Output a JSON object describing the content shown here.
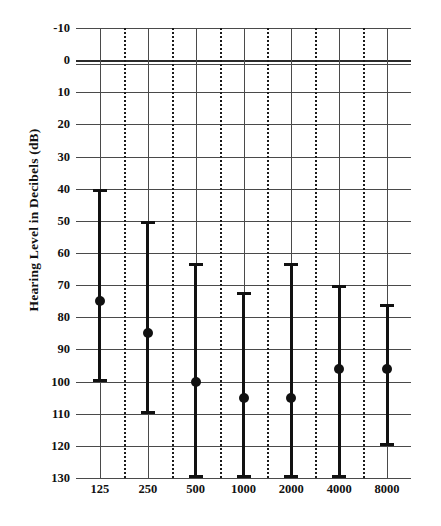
{
  "chart_data": {
    "type": "line",
    "title": "",
    "subtitle": "",
    "xlabel": "",
    "ylabel": "Hearing Level in Decibels (dB)",
    "categories": [
      "125",
      "250",
      "500",
      "1000",
      "2000",
      "4000",
      "8000"
    ],
    "x_tick_labels": [
      "125",
      "250",
      "500",
      "1000",
      "2000",
      "4000",
      "8000"
    ],
    "y_tick_labels": [
      "-10",
      "0",
      "10",
      "20",
      "30",
      "40",
      "50",
      "60",
      "70",
      "80",
      "90",
      "100",
      "110",
      "120",
      "130"
    ],
    "y_tick_values": [
      -10,
      0,
      10,
      20,
      30,
      40,
      50,
      60,
      70,
      80,
      90,
      100,
      110,
      120,
      130
    ],
    "ylim": [
      -10,
      130
    ],
    "y_axis_inverted": true,
    "grid": "major-horizontal-and-vertical-solid-plus-minor-vertical-dotted",
    "legend": "none",
    "series": [
      {
        "name": "Hearing level range",
        "marker": "filled-circle",
        "points": [
          {
            "x": "125",
            "value": 75,
            "upper": 40,
            "lower": 100
          },
          {
            "x": "250",
            "value": 85,
            "upper": 50,
            "lower": 110
          },
          {
            "x": "500",
            "value": 100,
            "upper": 63,
            "lower": 130
          },
          {
            "x": "1000",
            "value": 105,
            "upper": 72,
            "lower": 130
          },
          {
            "x": "2000",
            "value": 105,
            "upper": 63,
            "lower": 130
          },
          {
            "x": "4000",
            "value": 96,
            "upper": 70,
            "lower": 130
          },
          {
            "x": "8000",
            "value": 96,
            "upper": 76,
            "lower": 120
          }
        ]
      }
    ],
    "colors": {
      "data": "#111111",
      "grid": "#4a4a4a",
      "minor_grid": "#1b1b1b",
      "background": "#ffffff",
      "text": "#111111"
    }
  },
  "bleed": {
    "text": ""
  }
}
